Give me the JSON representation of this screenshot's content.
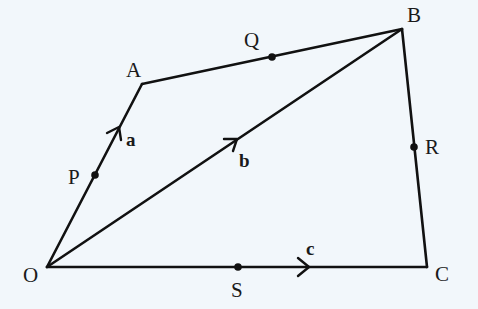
{
  "figure": {
    "background_color": "#f2f7fb",
    "line_color": "#111111"
  },
  "vertices": [
    {
      "id": "O",
      "label": "O"
    },
    {
      "id": "A",
      "label": "A"
    },
    {
      "id": "B",
      "label": "B"
    },
    {
      "id": "C",
      "label": "C"
    }
  ],
  "points": [
    {
      "id": "P",
      "label": "P",
      "on_segment": "OA"
    },
    {
      "id": "Q",
      "label": "Q",
      "on_segment": "AB"
    },
    {
      "id": "R",
      "label": "R",
      "on_segment": "BC"
    },
    {
      "id": "S",
      "label": "S",
      "on_segment": "OC"
    }
  ],
  "segments": [
    {
      "id": "OA",
      "from": "O",
      "to": "A"
    },
    {
      "id": "AB",
      "from": "A",
      "to": "B"
    },
    {
      "id": "BC",
      "from": "B",
      "to": "C"
    },
    {
      "id": "OC",
      "from": "O",
      "to": "C"
    },
    {
      "id": "OB",
      "from": "O",
      "to": "B"
    }
  ],
  "vectors": [
    {
      "id": "a",
      "label": "a",
      "segment": "OA",
      "direction": "O to A"
    },
    {
      "id": "b",
      "label": "b",
      "segment": "OB",
      "direction": "O to B"
    },
    {
      "id": "c",
      "label": "c",
      "segment": "OC",
      "direction": "O to C"
    }
  ]
}
